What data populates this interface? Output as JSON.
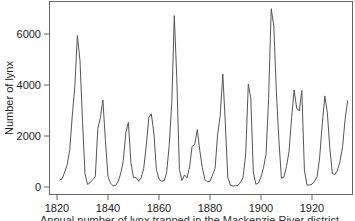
{
  "chart_data": {
    "type": "line",
    "title": "",
    "xlabel": "",
    "ylabel": "Number of lynx",
    "caption": "Annual number of lynx trapped in the Mackenzie River district",
    "xlim": [
      1815,
      1936
    ],
    "ylim": [
      -300,
      7400
    ],
    "grid": false,
    "legend": null,
    "x_ticks": [
      1820,
      1840,
      1860,
      1880,
      1900,
      1920
    ],
    "y_ticks": [
      0,
      2000,
      4000,
      6000
    ],
    "x_start": 1821,
    "series": [
      {
        "name": "lynx",
        "color": "#555555",
        "values": [
          269,
          321,
          585,
          871,
          1475,
          2821,
          3928,
          5943,
          4950,
          2577,
          523,
          98,
          184,
          279,
          409,
          2285,
          2685,
          3409,
          1824,
          409,
          151,
          45,
          68,
          213,
          546,
          1033,
          2129,
          2536,
          957,
          361,
          377,
          225,
          360,
          731,
          1638,
          2725,
          2871,
          2119,
          684,
          299,
          236,
          245,
          552,
          1623,
          3311,
          6721,
          4254,
          687,
          255,
          473,
          358,
          784,
          1594,
          1676,
          2251,
          1426,
          756,
          299,
          201,
          229,
          469,
          736,
          2042,
          2811,
          4431,
          2511,
          389,
          73,
          39,
          49,
          59,
          188,
          377,
          1292,
          4031,
          3495,
          587,
          105,
          153,
          387,
          758,
          1307,
          3465,
          6991,
          6313,
          3794,
          1836,
          345,
          382,
          808,
          1388,
          2713,
          3800,
          3091,
          2985,
          3790,
          674,
          81,
          80,
          108,
          229,
          399,
          1132,
          2432,
          3574,
          2935,
          1537,
          529,
          485,
          662,
          1000,
          1590,
          2657,
          3396
        ]
      }
    ]
  }
}
